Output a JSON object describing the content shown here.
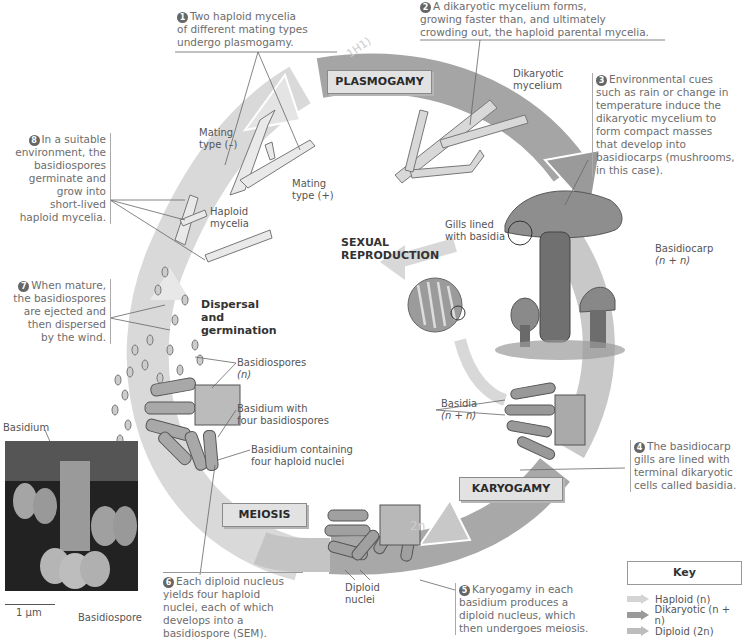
{
  "center_label": {
    "line1": "SEXUAL",
    "line2": "REPRODUCTION"
  },
  "stages": {
    "plasmogamy": "PLASMOGAMY",
    "karyogamy": "KARYOGAMY",
    "meiosis": "MEIOSIS",
    "dispersal": {
      "line1": "Dispersal",
      "line2": "and",
      "line3": "germination"
    }
  },
  "steps": [
    {
      "num": "1",
      "text": "Two haploid mycelia of different mating types undergo plasmogamy.",
      "lines": [
        "Two haploid mycelia",
        "of different mating types",
        "undergo plasmogamy."
      ]
    },
    {
      "num": "2",
      "text": "A dikaryotic mycelium forms, growing faster than, and ultimately crowding out, the haploid parental mycelia.",
      "lines": [
        "A dikaryotic mycelium forms,",
        "growing faster than, and ultimately",
        "crowding out, the haploid parental mycelia."
      ]
    },
    {
      "num": "3",
      "text": "Environmental cues such as rain or change in temperature induce the dikaryotic mycelium to form compact masses that develop into basidiocarps (mushrooms, in this case).",
      "lines": [
        "Environmental cues",
        "such as rain or change in",
        "temperature induce the",
        "dikaryotic mycelium to",
        "form compact masses",
        "that develop into",
        "basidiocarps (mushrooms,",
        "in this case)."
      ]
    },
    {
      "num": "4",
      "text": "The basidiocarp gills are lined with terminal dikaryotic cells called basidia.",
      "lines": [
        "The basidiocarp",
        "gills are lined with",
        "terminal dikaryotic",
        "cells called basidia."
      ]
    },
    {
      "num": "5",
      "text": "Karyogamy in each basidium produces a diploid nucleus, which then undergoes meiosis.",
      "lines": [
        "Karyogamy in each",
        "basidium produces a",
        "diploid nucleus, which",
        "then undergoes meiosis."
      ]
    },
    {
      "num": "6",
      "text": "Each diploid nucleus yields four haploid nuclei, each of which develops into a basidiospore (SEM).",
      "lines": [
        "Each diploid nucleus",
        "yields four haploid",
        "nuclei, each of which",
        "develops into a",
        "basidiospore (SEM)."
      ]
    },
    {
      "num": "7",
      "text": "When mature, the basidiospores are ejected and then dispersed by the wind.",
      "lines": [
        "When mature,",
        "the basidiospores",
        "are ejected and",
        "then dispersed",
        "by the wind."
      ]
    },
    {
      "num": "8",
      "text": "In a suitable environment, the basidiospores germinate and grow into short-lived haploid mycelia.",
      "lines": [
        "In a suitable",
        "environment, the",
        "basidiospores",
        "germinate and",
        "grow into",
        "short-lived",
        "haploid mycelia."
      ]
    }
  ],
  "labels": {
    "mating_minus": {
      "line1": "Mating",
      "line2": "type (–)"
    },
    "mating_plus": {
      "line1": "Mating",
      "line2": "type (+)"
    },
    "haploid_mycelia": {
      "line1": "Haploid",
      "line2": "mycelia"
    },
    "dikaryotic_mycelium": {
      "line1": "Dikaryotic",
      "line2": "mycelium"
    },
    "gills": {
      "line1": "Gills lined",
      "line2": "with basidia"
    },
    "basidiocarp": {
      "line1": "Basidiocarp",
      "line2": "(n + n)"
    },
    "basidia": {
      "line1": "Basidia",
      "line2": "(n + n)"
    },
    "diploid_nuclei": {
      "line1": "Diploid",
      "line2": "nuclei"
    },
    "basidiospores": {
      "line1": "Basidiospores",
      "line2": "(n)"
    },
    "basidium_four_spores": {
      "line1": "Basidium with",
      "line2": "four basidiospores"
    },
    "basidium_four_nuclei": {
      "line1": "Basidium containing",
      "line2": "four haploid nuclei"
    },
    "sem_basidium": "Basidium",
    "sem_basidiospore": "Basidiospore",
    "sem_scale": "1 µm"
  },
  "handwriting": {
    "top": "1H1)",
    "bottom": "2n"
  },
  "key": {
    "title": "Key",
    "items": [
      {
        "label": "Haploid (n)",
        "color": "#d4d4d4"
      },
      {
        "label": "Dikaryotic (n + n)",
        "color": "#9a9a9a"
      },
      {
        "label": "Diploid (2n)",
        "color": "#bdbdbd"
      }
    ]
  },
  "colors": {
    "haploid": "#d4d4d4",
    "dikaryotic": "#9a9a9a",
    "diploid": "#bdbdbd",
    "text": "#6d6d6d"
  }
}
